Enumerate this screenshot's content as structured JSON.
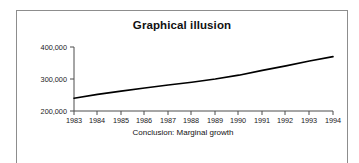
{
  "figure": {
    "title": "Graphical illusion",
    "caption": "Conclusion: Marginal growth",
    "frame_color": "#8d8d8d",
    "background_color": "#ffffff",
    "line_color": "#000000",
    "axis_color": "#4d4d4d"
  },
  "chart_data": {
    "type": "line",
    "title": "Graphical illusion",
    "subtitle": "Conclusion: Marginal growth",
    "xlabel": "",
    "ylabel": "",
    "categories": [
      "1983",
      "1984",
      "1985",
      "1986",
      "1987",
      "1988",
      "1989",
      "1990",
      "1991",
      "1992",
      "1993",
      "1994"
    ],
    "x": [
      1983,
      1984,
      1985,
      1986,
      1987,
      1988,
      1989,
      1990,
      1991,
      1992,
      1993,
      1994
    ],
    "values": [
      240000,
      252000,
      262000,
      272000,
      281000,
      290000,
      300000,
      312000,
      327000,
      341000,
      356000,
      370000
    ],
    "series": [
      {
        "name": "value",
        "values": [
          240000,
          252000,
          262000,
          272000,
          281000,
          290000,
          300000,
          312000,
          327000,
          341000,
          356000,
          370000
        ]
      }
    ],
    "ylim": [
      200000,
      400000
    ],
    "xlim": [
      1983,
      1994
    ],
    "ytick_labels": [
      "200,000",
      "300,000",
      "400,000"
    ],
    "ytick_values": [
      200000,
      300000,
      400000
    ],
    "xtick_labels": [
      "1983",
      "1984",
      "1985",
      "1986",
      "1987",
      "1988",
      "1989",
      "1990",
      "1991",
      "1992",
      "1993",
      "1994"
    ],
    "grid": false,
    "legend": false,
    "legend_position": "none",
    "annotations": [
      "Conclusion: Marginal growth"
    ],
    "note": "Y axis baseline truncated at 200,000 which visually flattens the growth"
  }
}
